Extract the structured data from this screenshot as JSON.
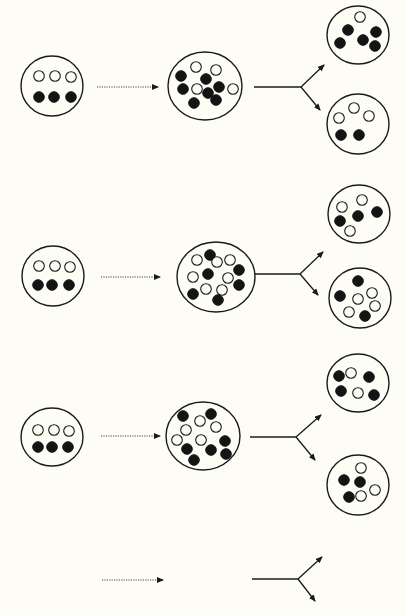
{
  "diagram": {
    "colors": {
      "background": "#fdfdf6",
      "ink": "#1a1a1a",
      "filled_dot": "#141414",
      "open_dot_fill": "#fdfdf6"
    },
    "dot_radius": 5.3,
    "rows": [
      {
        "id": "row-1",
        "source": {
          "cx": 52,
          "cy": 86,
          "rx": 31,
          "ry": 30,
          "dots": [
            {
              "x": 39,
              "y": 76,
              "type": "open"
            },
            {
              "x": 55,
              "y": 76,
              "type": "open"
            },
            {
              "x": 71,
              "y": 77,
              "type": "open"
            },
            {
              "x": 39,
              "y": 97,
              "type": "filled"
            },
            {
              "x": 54,
              "y": 97,
              "type": "filled"
            },
            {
              "x": 71,
              "y": 97,
              "type": "filled"
            }
          ]
        },
        "arrow": {
          "x1": 97,
          "x2": 158,
          "y": 87
        },
        "mixed": {
          "cx": 205,
          "cy": 86,
          "rx": 37,
          "ry": 34,
          "dots": [
            {
              "x": 196,
              "y": 67,
              "type": "open"
            },
            {
              "x": 216,
              "y": 70,
              "type": "open"
            },
            {
              "x": 181,
              "y": 76,
              "type": "filled"
            },
            {
              "x": 206,
              "y": 79,
              "type": "filled"
            },
            {
              "x": 183,
              "y": 89,
              "type": "filled"
            },
            {
              "x": 197,
              "y": 89,
              "type": "open"
            },
            {
              "x": 208,
              "y": 93,
              "type": "filled"
            },
            {
              "x": 219,
              "y": 87,
              "type": "filled"
            },
            {
              "x": 233,
              "y": 89,
              "type": "open"
            },
            {
              "x": 194,
              "y": 103,
              "type": "filled"
            },
            {
              "x": 216,
              "y": 100,
              "type": "filled"
            }
          ]
        },
        "fork": {
          "x1": 254,
          "xj": 301,
          "y": 87,
          "up": [
            324,
            65
          ],
          "down": [
            320,
            110
          ]
        },
        "daughter_top": {
          "cx": 358,
          "cy": 35,
          "rx": 31,
          "ry": 29,
          "dots": [
            {
              "x": 360,
              "y": 17,
              "type": "open"
            },
            {
              "x": 348,
              "y": 30,
              "type": "filled"
            },
            {
              "x": 376,
              "y": 32,
              "type": "filled"
            },
            {
              "x": 340,
              "y": 43,
              "type": "filled"
            },
            {
              "x": 363,
              "y": 40,
              "type": "filled"
            },
            {
              "x": 375,
              "y": 46,
              "type": "filled"
            }
          ]
        },
        "daughter_bottom": {
          "cx": 358,
          "cy": 124,
          "rx": 31,
          "ry": 30,
          "dots": [
            {
              "x": 354,
              "y": 108,
              "type": "open"
            },
            {
              "x": 339,
              "y": 118,
              "type": "open"
            },
            {
              "x": 369,
              "y": 116,
              "type": "open"
            },
            {
              "x": 341,
              "y": 135,
              "type": "filled"
            },
            {
              "x": 359,
              "y": 135,
              "type": "filled"
            }
          ]
        }
      },
      {
        "id": "row-2",
        "source": {
          "cx": 53,
          "cy": 276,
          "rx": 31,
          "ry": 30,
          "dots": [
            {
              "x": 39,
              "y": 266,
              "type": "open"
            },
            {
              "x": 55,
              "y": 266,
              "type": "open"
            },
            {
              "x": 70,
              "y": 267,
              "type": "open"
            },
            {
              "x": 38,
              "y": 285,
              "type": "filled"
            },
            {
              "x": 52,
              "y": 285,
              "type": "filled"
            },
            {
              "x": 69,
              "y": 285,
              "type": "filled"
            }
          ]
        },
        "arrow": {
          "x1": 101,
          "x2": 160,
          "y": 277
        },
        "mixed": {
          "cx": 216,
          "cy": 277,
          "rx": 39,
          "ry": 35,
          "dots": [
            {
              "x": 210,
              "y": 255,
              "type": "filled"
            },
            {
              "x": 197,
              "y": 260,
              "type": "open"
            },
            {
              "x": 217,
              "y": 262,
              "type": "open"
            },
            {
              "x": 230,
              "y": 260,
              "type": "open"
            },
            {
              "x": 239,
              "y": 270,
              "type": "filled"
            },
            {
              "x": 193,
              "y": 277,
              "type": "open"
            },
            {
              "x": 208,
              "y": 274,
              "type": "filled"
            },
            {
              "x": 228,
              "y": 278,
              "type": "open"
            },
            {
              "x": 239,
              "y": 285,
              "type": "filled"
            },
            {
              "x": 193,
              "y": 294,
              "type": "filled"
            },
            {
              "x": 206,
              "y": 289,
              "type": "open"
            },
            {
              "x": 222,
              "y": 290,
              "type": "open"
            },
            {
              "x": 218,
              "y": 300,
              "type": "filled"
            }
          ]
        },
        "fork": {
          "x1": 255,
          "xj": 300,
          "y": 274,
          "up": [
            323,
            252
          ],
          "down": [
            318,
            295
          ]
        },
        "daughter_top": {
          "cx": 359,
          "cy": 214,
          "rx": 31,
          "ry": 29,
          "dots": [
            {
              "x": 362,
              "y": 200,
              "type": "open"
            },
            {
              "x": 342,
              "y": 207,
              "type": "open"
            },
            {
              "x": 377,
              "y": 212,
              "type": "filled"
            },
            {
              "x": 358,
              "y": 216,
              "type": "filled"
            },
            {
              "x": 340,
              "y": 221,
              "type": "filled"
            },
            {
              "x": 350,
              "y": 231,
              "type": "open"
            }
          ]
        },
        "daughter_bottom": {
          "cx": 360,
          "cy": 298,
          "rx": 31,
          "ry": 30,
          "dots": [
            {
              "x": 358,
              "y": 281,
              "type": "filled"
            },
            {
              "x": 372,
              "y": 293,
              "type": "open"
            },
            {
              "x": 340,
              "y": 296,
              "type": "filled"
            },
            {
              "x": 358,
              "y": 299,
              "type": "open"
            },
            {
              "x": 375,
              "y": 306,
              "type": "open"
            },
            {
              "x": 349,
              "y": 312,
              "type": "open"
            },
            {
              "x": 365,
              "y": 316,
              "type": "filled"
            }
          ]
        }
      },
      {
        "id": "row-3",
        "source": {
          "cx": 52,
          "cy": 437,
          "rx": 31,
          "ry": 29,
          "dots": [
            {
              "x": 38,
              "y": 430,
              "type": "open"
            },
            {
              "x": 54,
              "y": 430,
              "type": "open"
            },
            {
              "x": 69,
              "y": 431,
              "type": "open"
            },
            {
              "x": 38,
              "y": 447,
              "type": "filled"
            },
            {
              "x": 52,
              "y": 447,
              "type": "filled"
            },
            {
              "x": 68,
              "y": 447,
              "type": "filled"
            }
          ]
        },
        "arrow": {
          "x1": 101,
          "x2": 160,
          "y": 436
        },
        "mixed": {
          "cx": 203,
          "cy": 436,
          "rx": 37,
          "ry": 34,
          "dots": [
            {
              "x": 183,
              "y": 416,
              "type": "filled"
            },
            {
              "x": 211,
              "y": 414,
              "type": "filled"
            },
            {
              "x": 200,
              "y": 421,
              "type": "open"
            },
            {
              "x": 216,
              "y": 427,
              "type": "open"
            },
            {
              "x": 186,
              "y": 430,
              "type": "open"
            },
            {
              "x": 177,
              "y": 440,
              "type": "open"
            },
            {
              "x": 201,
              "y": 440,
              "type": "open"
            },
            {
              "x": 225,
              "y": 441,
              "type": "filled"
            },
            {
              "x": 187,
              "y": 449,
              "type": "filled"
            },
            {
              "x": 211,
              "y": 450,
              "type": "filled"
            },
            {
              "x": 226,
              "y": 454,
              "type": "filled"
            },
            {
              "x": 194,
              "y": 460,
              "type": "filled"
            }
          ]
        },
        "fork": {
          "x1": 250,
          "xj": 296,
          "y": 437,
          "up": [
            321,
            415
          ],
          "down": [
            315,
            460
          ]
        },
        "daughter_top": {
          "cx": 358,
          "cy": 383,
          "rx": 31,
          "ry": 29,
          "dots": [
            {
              "x": 339,
              "y": 376,
              "type": "filled"
            },
            {
              "x": 351,
              "y": 373,
              "type": "open"
            },
            {
              "x": 369,
              "y": 377,
              "type": "filled"
            },
            {
              "x": 341,
              "y": 391,
              "type": "filled"
            },
            {
              "x": 358,
              "y": 393,
              "type": "open"
            },
            {
              "x": 374,
              "y": 395,
              "type": "filled"
            }
          ]
        },
        "daughter_bottom": {
          "cx": 358,
          "cy": 485,
          "rx": 31,
          "ry": 30,
          "dots": [
            {
              "x": 361,
              "y": 468,
              "type": "open"
            },
            {
              "x": 344,
              "y": 480,
              "type": "filled"
            },
            {
              "x": 360,
              "y": 482,
              "type": "filled"
            },
            {
              "x": 375,
              "y": 490,
              "type": "open"
            },
            {
              "x": 349,
              "y": 497,
              "type": "filled"
            },
            {
              "x": 361,
              "y": 496,
              "type": "open"
            }
          ]
        }
      },
      {
        "id": "row-4",
        "arrow": {
          "x1": 102,
          "x2": 163,
          "y": 580
        },
        "fork": {
          "x1": 252,
          "xj": 298,
          "y": 579,
          "up": [
            322,
            557
          ],
          "down": [
            315,
            601
          ]
        }
      }
    ]
  }
}
